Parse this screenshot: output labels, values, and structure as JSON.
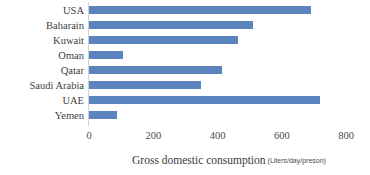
{
  "chart_data": {
    "type": "bar",
    "orientation": "horizontal",
    "title": "",
    "xlabel": "Gross domestic consumption",
    "xlabel_units": "(Liters/day/preson)",
    "ylabel": "",
    "xlim": [
      0,
      800
    ],
    "xticks": [
      0,
      200,
      400,
      600,
      800
    ],
    "xtick_labels": [
      "0",
      "200",
      "400",
      "600",
      "800"
    ],
    "grid": false,
    "legend": false,
    "series_color": "#5B84BE",
    "categories": [
      "USA",
      "Baharain",
      "Kuwait",
      "Oman",
      "Qatar",
      "Saudi Arabia",
      "UAE",
      "Yemen"
    ],
    "values": [
      690,
      510,
      465,
      105,
      415,
      350,
      720,
      88
    ],
    "series": [
      {
        "name": "Gross domestic consumption",
        "values": [
          690,
          510,
          465,
          105,
          415,
          350,
          720,
          88
        ]
      }
    ]
  }
}
